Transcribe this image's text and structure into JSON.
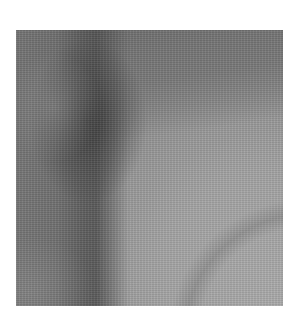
{
  "image": {
    "description": "Grayscale textured photograph showing a dark Y-shaped band with a lighter curved region in the lower right",
    "colors": {
      "background": "#ffffff",
      "dark_band": "#4a4a4a",
      "mid_tone": "#8e8e8e",
      "light_region": "#b0b0b0"
    }
  }
}
